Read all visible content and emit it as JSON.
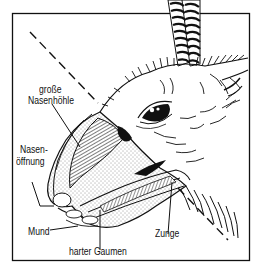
{
  "figure": {
    "type": "anatomical-cross-section",
    "colors": {
      "ink": "#111111",
      "paper": "#ffffff",
      "stipple": "#555555"
    },
    "labels": {
      "grosse_nasenhoehle_line1": "große",
      "grosse_nasenhoehle_line2": "Nasenhöhle",
      "nasenoeffnung_line1": "Nasen-",
      "nasenoeffnung_line2": "öffnung",
      "mund": "Mund",
      "harter_gaumen": "harter Gaumen",
      "zunge": "Zunge"
    }
  }
}
